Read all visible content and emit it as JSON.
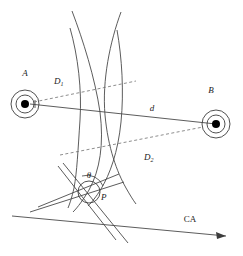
{
  "figure": {
    "labels": {
      "station_a": "A",
      "station_b": "B",
      "distance_1_base": "D",
      "distance_1_sub": "1",
      "distance_2_base": "D",
      "distance_2_sub": "2",
      "baseline": "d",
      "angle": "θ",
      "point_p": "P",
      "course_axis": "CA"
    },
    "colors": {
      "background": "#ffffff",
      "stroke": "#4a4a4a",
      "dashed_stroke": "#707070",
      "marker_core": "#000000",
      "text": "#1a1a1a"
    }
  }
}
